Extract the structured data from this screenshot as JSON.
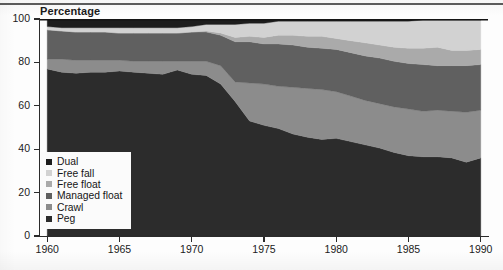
{
  "figure": {
    "axis_title": "Percentage"
  },
  "legend": {
    "items": [
      {
        "label": "Dual",
        "color": "#1d1d1d"
      },
      {
        "label": "Free fall",
        "color": "#d2d2d2"
      },
      {
        "label": "Free float",
        "color": "#aaaaaa"
      },
      {
        "label": "Managed float",
        "color": "#606060"
      },
      {
        "label": "Crawl",
        "color": "#8c8c8c"
      },
      {
        "label": "Peg",
        "color": "#2c2c2c"
      }
    ]
  },
  "chart_data": {
    "type": "area",
    "title": "",
    "subtitle": "",
    "xlabel": "",
    "ylabel": "Percentage",
    "xlim": [
      1959.5,
      1990.5
    ],
    "ylim": [
      0,
      100
    ],
    "grid": false,
    "legend_position": "inside-lower-left",
    "stacked": true,
    "stack_order_bottom_to_top": [
      "Peg",
      "Crawl",
      "Managed float",
      "Free float",
      "Free fall",
      "Dual"
    ],
    "x": [
      1960,
      1961,
      1962,
      1963,
      1964,
      1965,
      1966,
      1967,
      1968,
      1969,
      1970,
      1971,
      1972,
      1973,
      1974,
      1975,
      1976,
      1977,
      1978,
      1979,
      1980,
      1981,
      1982,
      1983,
      1984,
      1985,
      1986,
      1987,
      1988,
      1989,
      1990
    ],
    "xticks": [
      1960,
      1965,
      1970,
      1975,
      1980,
      1985,
      1990
    ],
    "yticks": [
      0,
      20,
      40,
      60,
      80,
      100
    ],
    "series": [
      {
        "name": "Peg",
        "color": "#2c2c2c",
        "values": [
          77,
          75.5,
          75,
          75.5,
          75.5,
          76,
          75.5,
          75,
          74.5,
          76.5,
          74.5,
          74,
          70,
          62,
          53,
          51,
          49.5,
          47,
          45.5,
          44.5,
          45,
          43.5,
          42,
          40.5,
          38.5,
          37,
          36.5,
          36.5,
          36,
          34,
          36
        ]
      },
      {
        "name": "Crawl",
        "color": "#8c8c8c",
        "values": [
          4.5,
          6,
          6,
          5.5,
          5.5,
          5,
          5,
          5.5,
          6,
          4,
          6,
          6.5,
          8.5,
          9,
          17.5,
          19,
          19.5,
          21.5,
          22.5,
          23,
          21.5,
          21,
          20.5,
          20.5,
          21,
          21.5,
          21,
          21.5,
          21.5,
          23,
          22
        ]
      },
      {
        "name": "Managed float",
        "color": "#606060",
        "values": [
          13.5,
          13,
          13,
          13,
          13,
          12.5,
          13,
          13,
          13,
          13,
          13.5,
          13.5,
          14,
          18.5,
          19,
          18.5,
          19.5,
          19.5,
          19,
          19,
          19.5,
          20,
          20.5,
          21,
          21,
          21,
          21.5,
          20.5,
          21,
          21.5,
          21
        ]
      },
      {
        "name": "Free float",
        "color": "#aaaaaa",
        "values": [
          0,
          0,
          0,
          0,
          0,
          0,
          0,
          0,
          0,
          0,
          0,
          0.5,
          1,
          2,
          2.5,
          3,
          4,
          4.5,
          5,
          5.5,
          5,
          5.5,
          6,
          6,
          6.5,
          7,
          7.5,
          8.5,
          7,
          7,
          7
        ]
      },
      {
        "name": "Free fall",
        "color": "#d2d2d2",
        "values": [
          1.5,
          1.5,
          2,
          2,
          2,
          2.5,
          2.5,
          2.5,
          2.5,
          2.5,
          2.5,
          3,
          4,
          6,
          6,
          6.5,
          6.5,
          6.5,
          7,
          7,
          8,
          9,
          10,
          11,
          12,
          12.5,
          13,
          12.5,
          14,
          14,
          13.5
        ]
      },
      {
        "name": "Dual",
        "color": "#1d1d1d",
        "values": [
          3.5,
          4,
          4,
          4,
          4,
          4,
          4,
          4,
          4,
          4,
          3.5,
          2.5,
          2.5,
          2.5,
          2,
          2,
          1,
          1,
          1,
          1,
          1,
          1,
          1,
          1,
          1,
          1,
          0.5,
          0.5,
          0.5,
          0.5,
          0.5
        ]
      }
    ]
  }
}
